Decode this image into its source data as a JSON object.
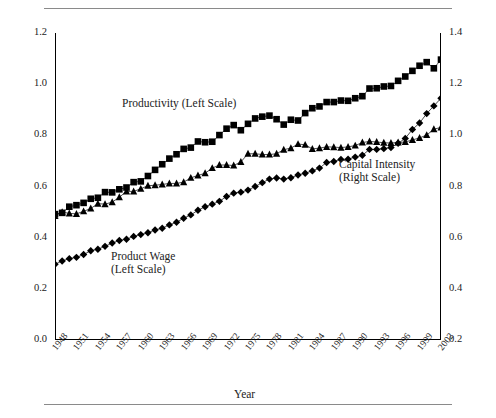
{
  "chart_data": {
    "type": "line",
    "title": "",
    "xlabel": "Year",
    "ylabel": "",
    "grid": false,
    "legend_position": "inline-annotations",
    "x_start": 1948,
    "x_end": 2002,
    "x_tick_step": 3,
    "xticks": [
      "1948",
      "1951",
      "1954",
      "1957",
      "1960",
      "1963",
      "1966",
      "1969",
      "1972",
      "1975",
      "1978",
      "1981",
      "1984",
      "1987",
      "1990",
      "1993",
      "1996",
      "1999",
      "2002"
    ],
    "left_axis": {
      "label": "",
      "ylim": [
        0.0,
        1.2
      ],
      "ticks": [
        "0.0",
        "0.2",
        "0.4",
        "0.6",
        "0.8",
        "1.0",
        "1.2"
      ],
      "tick_step": 0.2
    },
    "right_axis": {
      "label": "",
      "ylim": [
        0.2,
        1.4
      ],
      "ticks": [
        "0.2",
        "0.4",
        "0.6",
        "0.8",
        "1.0",
        "1.2",
        "1.4"
      ],
      "tick_step": 0.2
    },
    "x": [
      1948,
      1949,
      1950,
      1951,
      1952,
      1953,
      1954,
      1955,
      1956,
      1957,
      1958,
      1959,
      1960,
      1961,
      1962,
      1963,
      1964,
      1965,
      1966,
      1967,
      1968,
      1969,
      1970,
      1971,
      1972,
      1973,
      1974,
      1975,
      1976,
      1977,
      1978,
      1979,
      1980,
      1981,
      1982,
      1983,
      1984,
      1985,
      1986,
      1987,
      1988,
      1989,
      1990,
      1991,
      1992,
      1993,
      1994,
      1995,
      1996,
      1997,
      1998,
      1999,
      2000,
      2001,
      2002
    ],
    "series": [
      {
        "name": "Productivity (Left Scale)",
        "axis": "left",
        "marker": "square",
        "label_lines": [
          "Productivity (Left Scale)"
        ],
        "values": [
          0.492,
          0.497,
          0.521,
          0.527,
          0.536,
          0.552,
          0.556,
          0.578,
          0.577,
          0.589,
          0.596,
          0.617,
          0.62,
          0.641,
          0.665,
          0.687,
          0.709,
          0.726,
          0.747,
          0.752,
          0.776,
          0.773,
          0.775,
          0.801,
          0.826,
          0.84,
          0.82,
          0.845,
          0.866,
          0.873,
          0.877,
          0.863,
          0.842,
          0.861,
          0.858,
          0.887,
          0.906,
          0.913,
          0.93,
          0.93,
          0.936,
          0.935,
          0.945,
          0.953,
          0.983,
          0.984,
          0.991,
          0.993,
          1.013,
          1.03,
          1.052,
          1.072,
          1.086,
          1.062,
          1.096
        ]
      },
      {
        "name": "Product Wage (Left Scale)",
        "axis": "left",
        "marker": "diamond",
        "label_lines": [
          "Product Wage",
          "(Left Scale)"
        ],
        "values": [
          0.296,
          0.309,
          0.318,
          0.323,
          0.334,
          0.349,
          0.355,
          0.366,
          0.379,
          0.389,
          0.394,
          0.405,
          0.412,
          0.419,
          0.43,
          0.437,
          0.45,
          0.46,
          0.476,
          0.489,
          0.507,
          0.521,
          0.531,
          0.542,
          0.561,
          0.574,
          0.578,
          0.586,
          0.6,
          0.615,
          0.629,
          0.633,
          0.629,
          0.634,
          0.645,
          0.652,
          0.661,
          0.672,
          0.694,
          0.698,
          0.706,
          0.707,
          0.715,
          0.722,
          0.745,
          0.745,
          0.748,
          0.752,
          0.769,
          0.788,
          0.823,
          0.848,
          0.885,
          0.915,
          0.945
        ]
      },
      {
        "name": "Capital Intensity (Right Scale)",
        "axis": "right",
        "marker": "triangle",
        "label_lines": [
          "Capital Intensity",
          "(Right Scale)"
        ],
        "values": [
          0.685,
          0.7,
          0.695,
          0.693,
          0.703,
          0.714,
          0.733,
          0.731,
          0.739,
          0.758,
          0.781,
          0.781,
          0.791,
          0.803,
          0.805,
          0.808,
          0.812,
          0.812,
          0.817,
          0.834,
          0.843,
          0.852,
          0.872,
          0.884,
          0.884,
          0.882,
          0.896,
          0.928,
          0.928,
          0.925,
          0.925,
          0.928,
          0.944,
          0.95,
          0.966,
          0.963,
          0.947,
          0.95,
          0.955,
          0.954,
          0.952,
          0.955,
          0.96,
          0.972,
          0.976,
          0.974,
          0.971,
          0.97,
          0.972,
          0.974,
          0.982,
          0.99,
          1.001,
          1.024,
          1.031
        ]
      }
    ]
  },
  "axis_titles": {
    "x": "Year"
  }
}
